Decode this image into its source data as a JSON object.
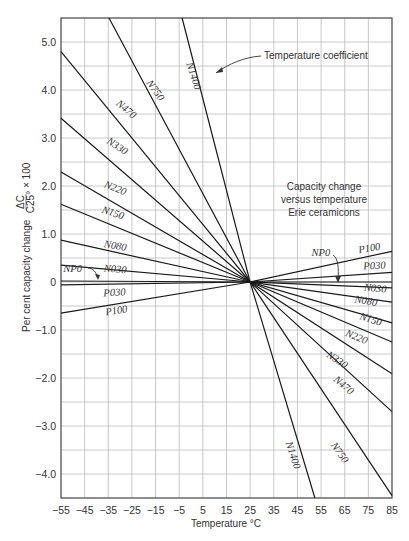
{
  "chart_data": {
    "type": "line",
    "title": "Capacity change versus temperature Erie ceramicons",
    "title_lines": [
      "Capacity change",
      "versus temperature",
      "Erie ceramicons"
    ],
    "xlabel": "Temperature °C",
    "ylabel": "Per cent capacity change ΔC/C25° × 100",
    "ylabel_prefix": "Per cent capacity change",
    "ylabel_frac_num": "ΔC",
    "ylabel_frac_den": "C25°",
    "ylabel_suffix": "× 100",
    "xlim": [
      -55,
      85
    ],
    "ylim": [
      -4.5,
      5.5
    ],
    "grid": true,
    "x_ticks": [
      -55,
      -45,
      -35,
      -25,
      -15,
      -5,
      5,
      15,
      25,
      35,
      45,
      55,
      65,
      75,
      85
    ],
    "x_tick_labels": [
      "−55",
      "−45",
      "−35",
      "−25",
      "−15",
      "−5",
      "5",
      "15",
      "25",
      "35",
      "45",
      "55",
      "65",
      "75",
      "85"
    ],
    "y_ticks": [
      5.0,
      4.0,
      3.0,
      2.0,
      1.0,
      0,
      -1.0,
      -2.0,
      -3.0,
      -4.0
    ],
    "y_tick_labels": [
      "5.0",
      "4.0",
      "3.0",
      "2.0",
      "1.0",
      "0",
      "−1.0",
      "−2.0",
      "−3.0",
      "−4.0"
    ],
    "y_minor_grid": [
      5.5,
      4.5,
      3.5,
      2.5,
      1.5,
      0.5,
      -0.5,
      -1.5,
      -2.5,
      -3.5,
      -4.5
    ],
    "annotation": "Temperature coefficient",
    "series": [
      {
        "name": "N1400",
        "points": [
          [
            -3.8,
            5.5
          ],
          [
            25,
            0
          ],
          [
            52.4,
            -4.5
          ]
        ],
        "label_left": {
          "x": -2,
          "y": 4.55,
          "rot": 72
        },
        "label_right": {
          "x": 40,
          "y": -3.35,
          "rot": 72
        }
      },
      {
        "name": "N750",
        "points": [
          [
            -34.7,
            5.5
          ],
          [
            25,
            0
          ],
          [
            85,
            -4.45
          ]
        ],
        "label_left": {
          "x": -19,
          "y": 4.15,
          "rot": 55
        },
        "label_right": {
          "x": 59,
          "y": -3.4,
          "rot": 55
        }
      },
      {
        "name": "N470",
        "points": [
          [
            -55,
            4.8
          ],
          [
            25,
            0
          ],
          [
            85,
            -2.7
          ]
        ],
        "label_left": {
          "x": -32,
          "y": 3.7,
          "rot": 40
        },
        "label_right": {
          "x": 60,
          "y": -2.05,
          "rot": 40
        }
      },
      {
        "name": "N330",
        "points": [
          [
            -55,
            3.41
          ],
          [
            25,
            0
          ],
          [
            85,
            -1.91
          ]
        ],
        "label_left": {
          "x": -36,
          "y": 2.9,
          "rot": 33
        },
        "label_right": {
          "x": 57,
          "y": -1.55,
          "rot": 33
        }
      },
      {
        "name": "N220",
        "points": [
          [
            -55,
            2.29
          ],
          [
            25,
            0
          ],
          [
            85,
            -1.25
          ]
        ],
        "label_left": {
          "x": -37,
          "y": 1.98,
          "rot": 22
        },
        "label_right": {
          "x": 65,
          "y": -1.12,
          "rot": 22
        }
      },
      {
        "name": "N150",
        "points": [
          [
            -55,
            1.62
          ],
          [
            25,
            0
          ],
          [
            85,
            -0.85
          ]
        ],
        "label_left": {
          "x": -38,
          "y": 1.45,
          "rot": 18
        },
        "label_right": {
          "x": 71,
          "y": -0.77,
          "rot": 18
        }
      },
      {
        "name": "N080",
        "points": [
          [
            -55,
            0.87
          ],
          [
            25,
            0
          ],
          [
            85,
            -0.42
          ]
        ],
        "label_left": {
          "x": -37,
          "y": 0.73,
          "rot": 10
        },
        "label_right": {
          "x": 69,
          "y": -0.42,
          "rot": 10
        }
      },
      {
        "name": "N030",
        "points": [
          [
            -55,
            0.35
          ],
          [
            25,
            0
          ],
          [
            85,
            -0.12
          ]
        ],
        "label_left": {
          "x": -37,
          "y": 0.22,
          "rot": 5
        },
        "label_right": {
          "x": 73,
          "y": -0.18,
          "rot": 5
        }
      },
      {
        "name": "NP0",
        "points": [
          [
            -55,
            0.02
          ],
          [
            25,
            0
          ],
          [
            85,
            0
          ]
        ],
        "label_left": {
          "x": -54,
          "y": 0.2,
          "rot": 0
        },
        "label_right": {
          "x": 51,
          "y": 0.55,
          "rot": 0
        }
      },
      {
        "name": "P030",
        "points": [
          [
            -55,
            -0.06
          ],
          [
            25,
            0
          ],
          [
            85,
            0.2
          ]
        ],
        "label_left": {
          "x": -37,
          "y": -0.3,
          "rot": -3
        },
        "label_right": {
          "x": 73,
          "y": 0.26,
          "rot": -3
        }
      },
      {
        "name": "P100",
        "points": [
          [
            -55,
            -0.65
          ],
          [
            25,
            0
          ],
          [
            85,
            0.64
          ]
        ],
        "label_left": {
          "x": -36,
          "y": -0.7,
          "rot": -9
        },
        "label_right": {
          "x": 71,
          "y": 0.6,
          "rot": -9
        }
      }
    ]
  }
}
